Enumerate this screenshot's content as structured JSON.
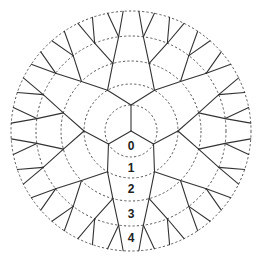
{
  "diagram": {
    "center": [
      131,
      131
    ],
    "ring_radii": [
      26,
      47,
      70,
      95,
      120
    ],
    "node_radii": [
      0,
      26,
      47,
      70,
      95,
      120
    ],
    "root_branches": 3,
    "root_angle_deg": -90,
    "branching": 2,
    "colors": {
      "edge": "#333333",
      "ring": "#555555",
      "label": "#222222",
      "background": "#ffffff"
    },
    "shell_labels": [
      {
        "text": "0",
        "x": 131,
        "y": 146
      },
      {
        "text": "1",
        "x": 131,
        "y": 168
      },
      {
        "text": "2",
        "x": 131,
        "y": 189
      },
      {
        "text": "3",
        "x": 131,
        "y": 214
      },
      {
        "text": "4",
        "x": 131,
        "y": 238
      }
    ]
  }
}
